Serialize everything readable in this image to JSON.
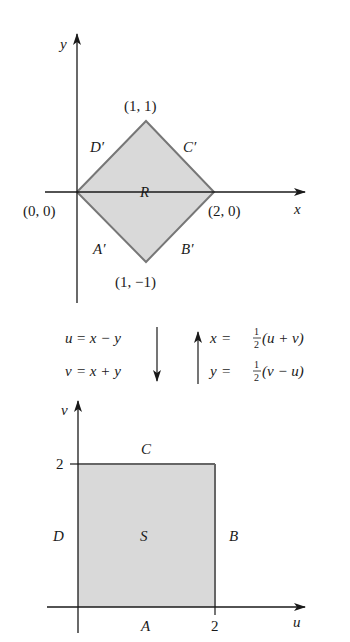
{
  "colors": {
    "fill": "#d9d9d9",
    "edge": "#777777",
    "axis": "#1a1a1a",
    "text": "#1a1a1a"
  },
  "top_plot": {
    "x_axis_label": "x",
    "y_axis_label": "y",
    "region_label": "R",
    "vertices": [
      {
        "label": "(0, 0)",
        "x": 0,
        "y": 0
      },
      {
        "label": "(1, 1)",
        "x": 1,
        "y": 1
      },
      {
        "label": "(2, 0)",
        "x": 2,
        "y": 0
      },
      {
        "label": "(1, −1)",
        "x": 1,
        "y": -1
      }
    ],
    "edges": {
      "A": "A′",
      "B": "B′",
      "C": "C′",
      "D": "D′"
    }
  },
  "transform": {
    "forward": {
      "eq1_lhs": "u",
      "eq1_rhs": "= x − y",
      "eq2_lhs": "v",
      "eq2_rhs": "= x + y"
    },
    "inverse": {
      "eq1_lhs": "x",
      "eq1_eq": "=",
      "eq1_rhs": "(u + v)",
      "eq2_lhs": "y",
      "eq2_eq": "=",
      "eq2_rhs": "(v − u)",
      "frac_num": "1",
      "frac_den": "2"
    }
  },
  "bottom_plot": {
    "x_axis_label": "u",
    "y_axis_label": "v",
    "region_label": "S",
    "x_tick": "2",
    "y_tick": "2",
    "edges": {
      "A": "A",
      "B": "B",
      "C": "C",
      "D": "D"
    }
  }
}
